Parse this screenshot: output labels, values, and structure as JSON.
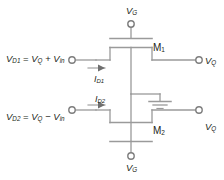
{
  "diagram": {
    "type": "circuit-schematic",
    "colors": {
      "background": "#ffffff",
      "wire": "#9a9a9a",
      "wire_dark": "#808080",
      "text": "#231f20",
      "terminal_fill": "#ffffff"
    },
    "labels": {
      "vd1_equation": {
        "var": "V",
        "var_sub": "D1",
        "equals": "=",
        "term1": "V",
        "term1_sub": "Q",
        "operator": "+",
        "term2": "V",
        "term2_sub": "in",
        "full": "V_D1 = V_Q + V_in"
      },
      "vd2_equation": {
        "var": "V",
        "var_sub": "D2",
        "equals": "=",
        "term1": "V",
        "term1_sub": "Q",
        "operator": "−",
        "term2": "V",
        "term2_sub": "in",
        "full": "V_D2 = V_Q − V_in"
      },
      "vg_top": {
        "var": "V",
        "sub": "G",
        "full": "V_G"
      },
      "vg_bottom": {
        "var": "V",
        "sub": "G",
        "full": "V_G"
      },
      "vq_top": {
        "var": "V",
        "sub": "Q",
        "full": "V_Q"
      },
      "vq_bottom": {
        "var": "V",
        "sub": "Q",
        "full": "V_Q"
      },
      "transistor_m1": {
        "var": "M",
        "sub": "1",
        "full": "M1"
      },
      "transistor_m2": {
        "var": "M",
        "sub": "2",
        "full": "M2"
      },
      "current_id1": {
        "var": "I",
        "sub": "D1",
        "full": "I_D1"
      },
      "current_id2": {
        "var": "I",
        "sub": "D2",
        "full": "I_D2"
      }
    },
    "components": [
      {
        "name": "transistor-m1",
        "kind": "mosfet",
        "label": "M1"
      },
      {
        "name": "transistor-m2",
        "kind": "mosfet",
        "label": "M2"
      },
      {
        "name": "ground",
        "kind": "ground-symbol"
      }
    ],
    "terminals": [
      {
        "name": "gate-top",
        "label": "V_G"
      },
      {
        "name": "gate-bottom",
        "label": "V_G"
      },
      {
        "name": "drain-input-1",
        "label": "V_D1 = V_Q + V_in"
      },
      {
        "name": "drain-input-2",
        "label": "V_D2 = V_Q − V_in"
      },
      {
        "name": "source-output-1",
        "label": "V_Q"
      },
      {
        "name": "source-output-2",
        "label": "V_Q"
      }
    ]
  }
}
